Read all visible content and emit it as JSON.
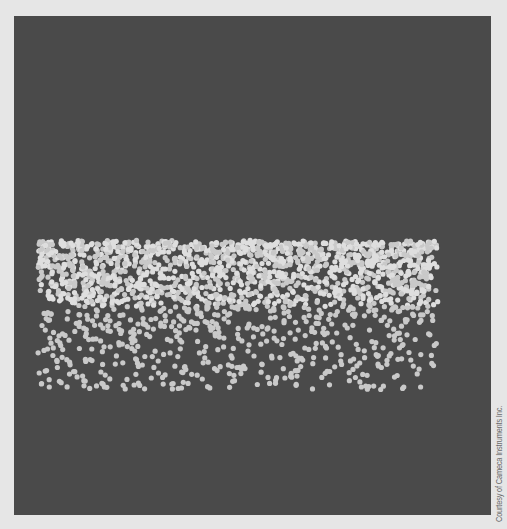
{
  "image": {
    "description": "Atom probe tomography reconstruction showing a band of atoms (light dots) on a dark gray background",
    "background_color": "#4a4a4a",
    "page_color": "#e6e6e6",
    "dot_color": "#c9c9c9",
    "dot_color_bright": "#dedede",
    "dot_radius": 2.6
  },
  "atom_band": {
    "x_min": 24,
    "x_max": 424,
    "y_top": 226,
    "dense_bottom": 290,
    "y_bottom": 374,
    "dense_count": 1500,
    "sparse_count": 520
  },
  "credit": {
    "text": "Courtesy of Cameca Instruments Inc."
  }
}
